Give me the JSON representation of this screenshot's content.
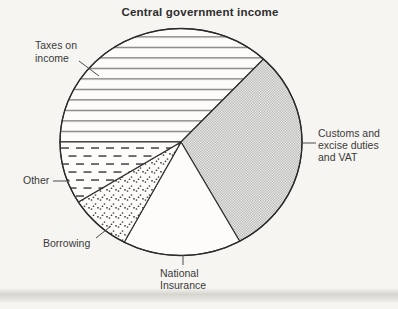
{
  "title": "Central government income",
  "colors": {
    "background": "#f6f5f1",
    "ink": "#3a3a3a",
    "pattern_gray": "#a6a6a6"
  },
  "chart_data": {
    "type": "pie",
    "title": "Central government income",
    "legend_position": "callout-labels-around-pie",
    "note": "monochrome textbook pie chart; slices filled with hatch patterns, no numeric labels shown; percentages estimated from measured arc angles",
    "segments": [
      {
        "label": "Taxes on income",
        "callout_lines": [
          "Taxes on",
          "income"
        ],
        "start_angle_deg": 47,
        "end_angle_deg": 180,
        "angle_deg": 133,
        "percent_est": 37,
        "pattern": "horizontal-lines"
      },
      {
        "label": "Customs and excise duties and VAT",
        "callout_lines": [
          "Customs and",
          "excise duties",
          "and VAT"
        ],
        "start_angle_deg": 299,
        "end_angle_deg": 407,
        "angle_deg": 108,
        "percent_est": 30,
        "pattern": "checker-halftone"
      },
      {
        "label": "National Insurance",
        "callout_lines": [
          "National",
          "Insurance"
        ],
        "start_angle_deg": 242,
        "end_angle_deg": 299,
        "angle_deg": 57,
        "percent_est": 16,
        "pattern": "plain-white"
      },
      {
        "label": "Borrowing",
        "callout_lines": [
          "Borrowing"
        ],
        "start_angle_deg": 212,
        "end_angle_deg": 242,
        "angle_deg": 30,
        "percent_est": 8,
        "pattern": "stipple-dots"
      },
      {
        "label": "Other",
        "callout_lines": [
          "Other"
        ],
        "start_angle_deg": 180,
        "end_angle_deg": 212,
        "angle_deg": 32,
        "percent_est": 9,
        "pattern": "dashed-lines"
      }
    ]
  }
}
